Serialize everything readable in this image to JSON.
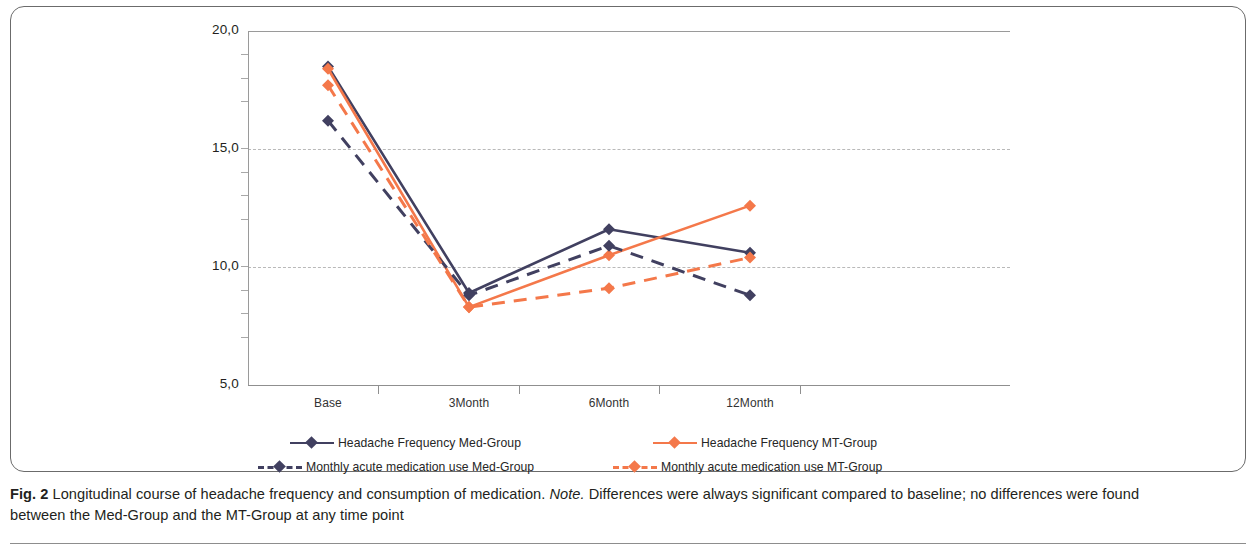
{
  "figure": {
    "number_label": "Fig. 2",
    "caption_part1": " Longitudinal course of headache frequency and consumption of medication. ",
    "caption_note_word": "Note.",
    "caption_part2": " Differences were always significant compared to baseline; no differences were found between the Med-Group and the MT-Group at any time point"
  },
  "colors": {
    "med_group": "#414060",
    "mt_group": "#f4784a",
    "gridline": "#b9b9b9",
    "axis": "#8f8f8f",
    "frame": "#6b6b6b",
    "text": "#231f20"
  },
  "legend": {
    "items": [
      {
        "label": "Headache Frequency Med-Group",
        "color": "#414060",
        "style": "solid",
        "marker": "diamond"
      },
      {
        "label": "Headache Frequency MT-Group",
        "color": "#f4784a",
        "style": "solid",
        "marker": "diamond"
      },
      {
        "label": "Monthly acute medication use Med-Group",
        "color": "#414060",
        "style": "dashed",
        "marker": "diamond"
      },
      {
        "label": "Monthly acute medication use MT-Group",
        "color": "#f4784a",
        "style": "dashed",
        "marker": "diamond"
      }
    ]
  },
  "chart_data": {
    "type": "line",
    "title": "",
    "xlabel": "",
    "ylabel": "",
    "categories": [
      "Base",
      "3Month",
      "6Month",
      "12Month"
    ],
    "ytick_labels": [
      "20,0",
      "15,0",
      "10,0",
      "5,0"
    ],
    "ytick_values": [
      20.0,
      15.0,
      10.0,
      5.0
    ],
    "ylim": [
      5.0,
      20.0
    ],
    "grid": true,
    "legend_position": "bottom",
    "series": [
      {
        "name": "Headache Frequency Med-Group",
        "color": "#414060",
        "style": "solid",
        "marker": "diamond",
        "values": [
          18.5,
          8.9,
          11.6,
          10.6
        ]
      },
      {
        "name": "Headache Frequency MT-Group",
        "color": "#f4784a",
        "style": "solid",
        "marker": "diamond",
        "values": [
          18.4,
          8.3,
          10.5,
          12.6
        ]
      },
      {
        "name": "Monthly acute medication use Med-Group",
        "color": "#414060",
        "style": "dashed",
        "marker": "diamond",
        "values": [
          16.2,
          8.8,
          10.9,
          8.8
        ]
      },
      {
        "name": "Monthly acute medication use MT-Group",
        "color": "#f4784a",
        "style": "dashed",
        "marker": "diamond",
        "values": [
          17.7,
          8.3,
          9.1,
          10.4
        ]
      }
    ]
  }
}
